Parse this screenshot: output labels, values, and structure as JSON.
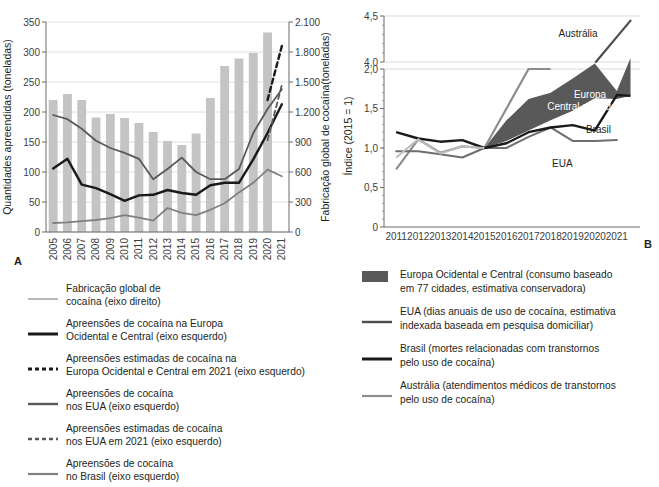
{
  "figure": {
    "panel_a_letter": "A",
    "panel_b_letter": "B"
  },
  "panel_a": {
    "y_left_title": "Quantidades apreendidas (toneladas)",
    "y_right_title": "Fabricação global de cocaína(toneladas)",
    "y_left_ticks": [
      "0",
      "50",
      "100",
      "150",
      "200",
      "250",
      "300",
      "350"
    ],
    "y_right_ticks": [
      "0",
      "300",
      "600",
      "900",
      "1.200",
      "1.500",
      "1.800",
      "2.100"
    ],
    "x_ticks": [
      "2005",
      "2006",
      "2007",
      "2008",
      "2009",
      "2010",
      "2011",
      "2012",
      "2013",
      "2014",
      "2015",
      "2016",
      "2017",
      "2018",
      "2019",
      "2020",
      "2021"
    ],
    "legend": [
      {
        "key": "line-thin-light",
        "color": "#a8a8a8",
        "text": "Fabricação global de\ncocaína (eixo direito)"
      },
      {
        "key": "line-thick-black",
        "color": "#1a1a1a",
        "text": "Apreensões de cocaína na Europa\nOcidental e Central (eixo esquerdo)"
      },
      {
        "key": "dash-thick-black",
        "color": "#1a1a1a",
        "text": "Apreensões estimadas de cocaína na\nEuropa Ocidental e Central em 2021 (eixo esquerdo)"
      },
      {
        "key": "line-medium-dark",
        "color": "#595959",
        "text": "Apreensões de cocaína\nnos EUA (eixo esquerdo)"
      },
      {
        "key": "dash-medium-dark",
        "color": "#595959",
        "text": "Apreensões estimadas de cocaína\nnos EUA em 2021 (eixo esquerdo)"
      },
      {
        "key": "line-medium-gray",
        "color": "#808080",
        "text": "Apreensões de cocaína\nno Brasil (eixo esquerdo)"
      }
    ]
  },
  "panel_b": {
    "y_title": "Índice (2015 = 1)",
    "y_ticks": [
      "0",
      "0,5",
      "1,0",
      "1,5",
      "2,0",
      "4,0",
      "4,5"
    ],
    "x_ticks": [
      "2011",
      "2012",
      "2013",
      "2014",
      "2015",
      "2016",
      "2017",
      "2018",
      "2019",
      "2020",
      "2021"
    ],
    "annotations": {
      "australia": "Austrália",
      "europa": "Europa\nCentral e Ocidental",
      "brasil": "Brasil",
      "eua": "EUA"
    },
    "legend": [
      {
        "key": "swatch-gray",
        "color": "#595959",
        "text": "Europa Ocidental e Central (consumo baseado\nem 77 cidades, estimativa conservadora)"
      },
      {
        "key": "line-medium-dark",
        "color": "#4d4d4d",
        "text": "EUA (dias anuais de uso de cocaína, estimativa\nindexada baseada em pesquisa domiciliar)"
      },
      {
        "key": "line-thick-black",
        "color": "#1a1a1a",
        "text": "Brasil (mortes relacionadas com transtornos\npelo uso de cocaína)"
      },
      {
        "key": "line-medium-gray",
        "color": "#8c8c8c",
        "text": "Austrália (atendimentos médicos de transtornos\npelo uso de cocaína)"
      }
    ]
  },
  "colors": {
    "bar": "#c4c4c4",
    "grid": "#d6d6d6",
    "axis": "#6b6b6b",
    "manufacture": "#a8a8a8",
    "europe_seizure": "#1a1a1a",
    "usa_seizure": "#595959",
    "brazil_seizure": "#808080",
    "band": "#595959",
    "australia": "#8c8c8c"
  },
  "chart_data": [
    {
      "type": "bar",
      "id": "panel-a",
      "title": "",
      "xlabel": "",
      "ylabel": "Quantidades apreendidas (toneladas)",
      "y2label": "Fabricação global de cocaína(toneladas)",
      "ylim": [
        0,
        350
      ],
      "y2lim": [
        0,
        2100
      ],
      "grid": true,
      "legend_position": "below",
      "categories": [
        "2005",
        "2006",
        "2007",
        "2008",
        "2009",
        "2010",
        "2011",
        "2012",
        "2013",
        "2014",
        "2015",
        "2016",
        "2017",
        "2018",
        "2019",
        "2020",
        "2021"
      ],
      "series": [
        {
          "name": "Fabricação global de cocaína (eixo direito)",
          "type": "bar",
          "axis": "right",
          "units": "toneladas",
          "values": [
            1320,
            1380,
            1320,
            1145,
            1180,
            1140,
            1090,
            1000,
            910,
            870,
            985,
            1340,
            1660,
            1735,
            1790,
            1995,
            null
          ]
        },
        {
          "name": "Fabricação global de cocaína (eixo direito, linha)",
          "type": "line",
          "axis": "left",
          "note": "plotted against left scale in source rendering",
          "values": [
            195,
            188,
            172,
            152,
            140,
            132,
            122,
            88,
            105,
            124,
            100,
            88,
            88,
            105,
            165,
            205,
            238
          ]
        },
        {
          "name": "Apreensões de cocaína na Europa Ocidental e Central (eixo esquerdo)",
          "type": "line",
          "axis": "left",
          "units": "toneladas",
          "values": [
            106,
            122,
            79,
            73,
            63,
            52,
            61,
            62,
            70,
            65,
            62,
            78,
            82,
            82,
            121,
            165,
            213
          ]
        },
        {
          "name": "Apreensões estimadas de cocaína na Europa Ocidental e Central em 2021 (eixo esquerdo)",
          "type": "line-dashed",
          "axis": "left",
          "units": "toneladas",
          "values": [
            null,
            null,
            null,
            null,
            null,
            null,
            null,
            null,
            null,
            null,
            null,
            null,
            null,
            null,
            null,
            220,
            310
          ]
        },
        {
          "name": "Apreensões de cocaína nos EUA (eixo esquerdo)",
          "type": "line",
          "axis": "left",
          "units": "toneladas",
          "values": [
            195,
            188,
            172,
            152,
            140,
            132,
            122,
            88,
            105,
            124,
            100,
            88,
            88,
            105,
            165,
            205,
            238
          ]
        },
        {
          "name": "Apreensões estimadas de cocaína nos EUA em 2021 (eixo esquerdo)",
          "type": "line-dashed",
          "axis": "left",
          "units": "toneladas",
          "values": [
            null,
            null,
            null,
            null,
            null,
            null,
            null,
            null,
            null,
            null,
            null,
            null,
            null,
            null,
            null,
            153,
            245
          ]
        },
        {
          "name": "Apreensões de cocaína no Brasil (eixo esquerdo)",
          "type": "line",
          "axis": "left",
          "units": "toneladas",
          "values": [
            15,
            16,
            18,
            20,
            23,
            28,
            24,
            19,
            40,
            32,
            28,
            37,
            48,
            66,
            82,
            104,
            93
          ]
        }
      ]
    },
    {
      "type": "line",
      "id": "panel-b",
      "title": "",
      "xlabel": "",
      "ylabel": "Índice (2015 = 1)",
      "ylim": [
        0,
        4.5
      ],
      "y_axis_break": [
        2.0,
        4.0
      ],
      "grid": true,
      "legend_position": "below",
      "x": [
        "2011",
        "2012",
        "2013",
        "2014",
        "2015",
        "2016",
        "2017",
        "2018",
        "2019",
        "2020",
        "2021"
      ],
      "series": [
        {
          "name": "Europa Ocidental e Central (consumo baseado em 77 cidades, estimativa conservadora)",
          "type": "band",
          "upper": [
            null,
            null,
            null,
            null,
            1.0,
            1.35,
            1.62,
            1.7,
            1.88,
            2.07,
            1.72,
            2.14
          ],
          "lower": [
            null,
            null,
            null,
            null,
            1.0,
            1.09,
            1.22,
            1.35,
            1.47,
            1.63,
            1.62,
            1.66
          ]
        },
        {
          "name": "EUA (dias anuais de uso de cocaína, estimativa indexada baseada em pesquisa domiciliar)",
          "type": "line",
          "values": [
            0.96,
            0.96,
            0.92,
            0.88,
            1.0,
            1.0,
            1.14,
            1.26,
            1.09,
            1.09,
            1.1
          ]
        },
        {
          "name": "Brasil (mortes relacionadas com transtornos pelo uso de cocaína)",
          "type": "line",
          "values": [
            1.2,
            1.12,
            1.08,
            1.1,
            1.0,
            1.06,
            1.2,
            1.26,
            1.29,
            1.22,
            1.67
          ]
        },
        {
          "name": "Austrália (atendimentos médicos de transtornos pelo uso de cocaína)",
          "type": "line",
          "values": [
            0.73,
            1.11,
            0.94,
            1.02,
            1.0,
            1.5,
            2.55,
            4.0,
            null,
            null,
            4.45
          ]
        }
      ]
    }
  ]
}
